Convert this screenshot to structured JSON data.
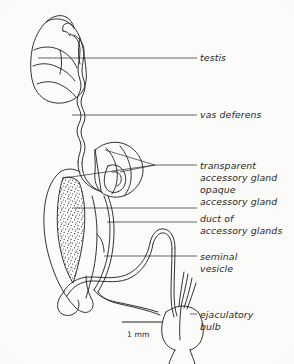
{
  "figure": {
    "ink_color": "#2a2724",
    "background_color": "#fbfbfa"
  },
  "labels": [
    {
      "id": "testis",
      "text": "testis",
      "x": 200,
      "y": 52
    },
    {
      "id": "vas-deferens",
      "text": "vas deferens",
      "x": 200,
      "y": 109
    },
    {
      "id": "transparent",
      "text": "transparent",
      "x": 200,
      "y": 160
    },
    {
      "id": "accessory-gland-1",
      "text": "accessory gland",
      "x": 200,
      "y": 172
    },
    {
      "id": "opaque",
      "text": "opaque",
      "x": 200,
      "y": 184
    },
    {
      "id": "accessory-gland-2",
      "text": "accessory gland",
      "x": 200,
      "y": 196
    },
    {
      "id": "duct-of",
      "text": "duct of",
      "x": 200,
      "y": 213
    },
    {
      "id": "accessory-glands",
      "text": "accessory glands",
      "x": 200,
      "y": 225
    },
    {
      "id": "seminal",
      "text": "seminal",
      "x": 200,
      "y": 251
    },
    {
      "id": "vesicle",
      "text": "vesicle",
      "x": 200,
      "y": 263
    },
    {
      "id": "ejaculatory",
      "text": "ejaculatory",
      "x": 200,
      "y": 309
    },
    {
      "id": "bulb",
      "text": "bulb",
      "x": 200,
      "y": 321
    }
  ],
  "scale_bar": {
    "value": "1 mm",
    "label_x": 127,
    "label_y": 330,
    "line_x1": 122,
    "line_x2": 163,
    "line_y": 322
  },
  "leader_lines": [
    {
      "id": "leader-testis",
      "points": "38,58 197,58"
    },
    {
      "id": "leader-vas-deferens",
      "points": "72,115 197,115"
    },
    {
      "id": "leader-transparent-a",
      "points": "64,178 155,165"
    },
    {
      "id": "leader-transparent-b",
      "points": "105,150 155,165"
    },
    {
      "id": "leader-transparent-c",
      "points": "120,172 155,165"
    },
    {
      "id": "leader-transparent-main",
      "points": "155,165 197,165"
    },
    {
      "id": "leader-opaque-gland",
      "points": "73,208 197,208"
    },
    {
      "id": "leader-duct",
      "points": "107,222 197,222"
    },
    {
      "id": "leader-seminal-vesicle",
      "points": "104,256 197,256"
    },
    {
      "id": "leader-ejaculatory-bulb",
      "points": "190,314 197,314"
    }
  ],
  "structures": [
    {
      "id": "testis-outline",
      "name": "testis"
    },
    {
      "id": "vas-deferens-tube",
      "name": "vas deferens"
    },
    {
      "id": "transparent-gland",
      "name": "transparent accessory gland"
    },
    {
      "id": "opaque-gland-stippled",
      "name": "opaque accessory gland"
    },
    {
      "id": "accessory-gland-duct",
      "name": "duct of accessory glands"
    },
    {
      "id": "seminal-vesicle-loop",
      "name": "seminal vesicle"
    },
    {
      "id": "ejaculatory-bulb-shape",
      "name": "ejaculatory bulb"
    }
  ]
}
